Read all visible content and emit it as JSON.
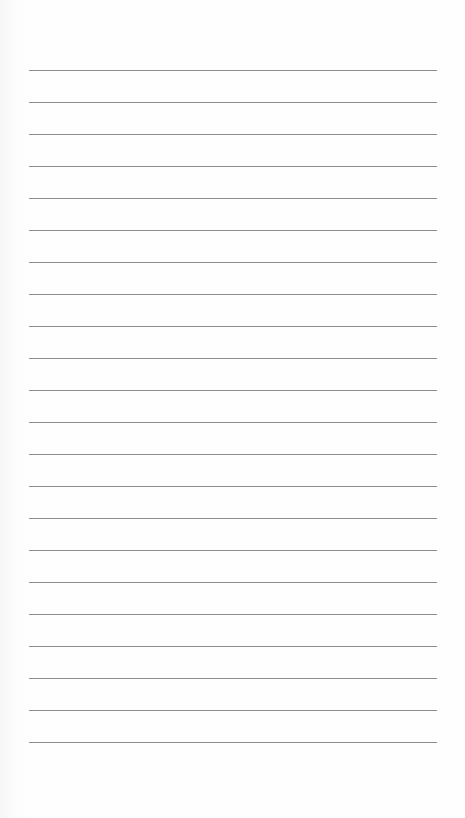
{
  "page": {
    "type": "lined-paper",
    "background_color": "#fefefe",
    "line_color": "#8c8c8c",
    "line_count": 22,
    "first_line_y": 70,
    "line_spacing": 32,
    "line_left_x": 29,
    "line_width": 408
  }
}
